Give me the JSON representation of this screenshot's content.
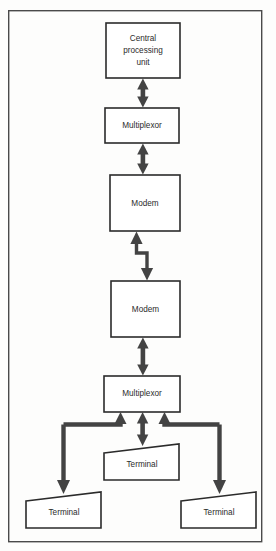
{
  "diagram": {
    "frame": {
      "name": "diagram-border",
      "x": 8,
      "y": 10,
      "width": 254,
      "height": 532,
      "stroke_color": "#4a4a4a"
    },
    "colors": {
      "box_fill": "#ffffff",
      "box_stroke": "#2b2b2b",
      "arrow": "#434343",
      "text": "#2b2b2b",
      "background": "#fdfdfc"
    },
    "nodes": [
      {
        "id": "cpu",
        "shape": "rectangle",
        "label_lines": [
          "Central",
          "processing",
          "unit"
        ],
        "x": 106,
        "y": 23,
        "width": 74,
        "height": 55
      },
      {
        "id": "multiplexor-top",
        "shape": "rectangle",
        "label_lines": [
          "Multiplexor"
        ],
        "x": 105,
        "y": 108,
        "width": 74,
        "height": 35
      },
      {
        "id": "modem-top",
        "shape": "rectangle",
        "label_lines": [
          "Modem"
        ],
        "x": 110,
        "y": 175,
        "width": 70,
        "height": 56
      },
      {
        "id": "modem-bottom",
        "shape": "rectangle",
        "label_lines": [
          "Modem"
        ],
        "x": 111,
        "y": 281,
        "width": 69,
        "height": 56
      },
      {
        "id": "multiplexor-bottom",
        "shape": "rectangle",
        "label_lines": [
          "Multiplexor"
        ],
        "x": 104,
        "y": 376,
        "width": 76,
        "height": 36
      },
      {
        "id": "terminal-center",
        "shape": "trapezoid",
        "label_lines": [
          "Terminal"
        ],
        "x": 104,
        "y": 444,
        "width": 75,
        "height": 36,
        "slant": 9
      },
      {
        "id": "terminal-left",
        "shape": "trapezoid",
        "label_lines": [
          "Terminal"
        ],
        "x": 26,
        "y": 492,
        "width": 75,
        "height": 36,
        "slant": 9
      },
      {
        "id": "terminal-right",
        "shape": "trapezoid",
        "label_lines": [
          "Terminal"
        ],
        "x": 181,
        "y": 492,
        "width": 75,
        "height": 36,
        "slant": 9
      }
    ],
    "connectors": [
      {
        "id": "cpu-to-multiplexor-top",
        "type": "double-headed-arrow",
        "orientation": "vertical",
        "from": "cpu",
        "to": "multiplexor-top"
      },
      {
        "id": "multiplexor-top-to-modem-top",
        "type": "double-headed-arrow",
        "orientation": "vertical",
        "from": "multiplexor-top",
        "to": "modem-top"
      },
      {
        "id": "modem-to-modem-link",
        "type": "zigzag-telephone-line",
        "orientation": "vertical",
        "from": "modem-top",
        "to": "modem-bottom"
      },
      {
        "id": "modem-bottom-to-multiplexor-bottom",
        "type": "double-headed-arrow",
        "orientation": "vertical",
        "from": "modem-bottom",
        "to": "multiplexor-bottom"
      },
      {
        "id": "multiplexor-bottom-to-terminal-center",
        "type": "double-headed-arrow",
        "orientation": "vertical",
        "from": "multiplexor-bottom",
        "to": "terminal-center"
      },
      {
        "id": "multiplexor-bottom-to-terminal-left",
        "type": "elbow-arrow-pair",
        "orientation": "left-branch",
        "from": "multiplexor-bottom",
        "to": "terminal-left"
      },
      {
        "id": "multiplexor-bottom-to-terminal-right",
        "type": "elbow-arrow-pair",
        "orientation": "right-branch",
        "from": "multiplexor-bottom",
        "to": "terminal-right"
      }
    ]
  }
}
